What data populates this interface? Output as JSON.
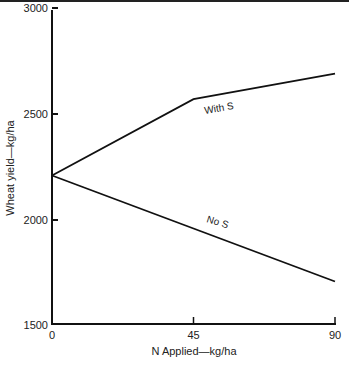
{
  "chart_data": {
    "type": "line",
    "title": "",
    "xlabel": "N Applied—kg/ha",
    "ylabel": "Wheat yield—kg/ha",
    "x": [
      0,
      45,
      90
    ],
    "x_ticks": [
      "0",
      "45",
      "90"
    ],
    "y_ticks": [
      "1500",
      "2000",
      "2500",
      "3000"
    ],
    "xlim": [
      0,
      90
    ],
    "ylim": [
      1500,
      3000
    ],
    "grid": false,
    "legend": "inline labels",
    "series": [
      {
        "name": "With S",
        "values": [
          2210,
          2570,
          2690
        ]
      },
      {
        "name": "No S",
        "values": [
          2210,
          1960,
          1710
        ]
      }
    ]
  },
  "labels": {
    "with_s": "With S",
    "no_s": "No S"
  }
}
